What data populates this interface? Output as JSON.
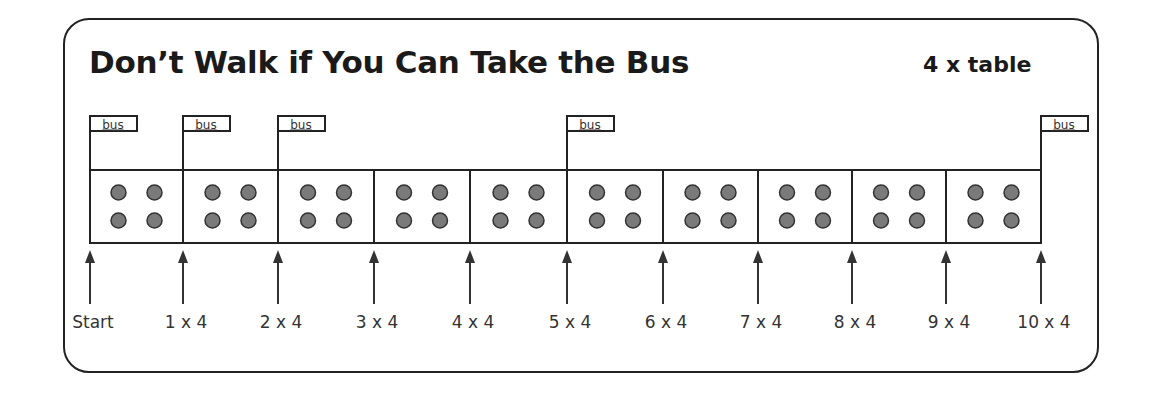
{
  "title": "Don’t Walk if You Can Take the Bus",
  "subtitle": "4 x table",
  "bus_label": "bus",
  "colors": {
    "line": "#222222",
    "dot_fill": "#7a7a7a",
    "dot_stroke": "#333333",
    "text": "#1a1a1a"
  },
  "boxes": {
    "count": 10,
    "dots_per_box": 4
  },
  "marker_positions_x": [
    90,
    183,
    278,
    374,
    470,
    567,
    663,
    758,
    852,
    946,
    1041
  ],
  "bus_stops_at_markers": [
    0,
    1,
    2,
    5,
    10
  ],
  "labels": [
    "Start",
    "1 x 4",
    "2 x 4",
    "3 x 4",
    "4 x 4",
    "5 x 4",
    "6 x 4",
    "7 x 4",
    "8 x  4",
    "9 x  4",
    "10 x 4"
  ]
}
